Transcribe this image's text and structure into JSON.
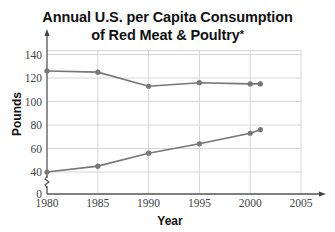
{
  "title_line1": "Annual U.S. per Capita Consumption",
  "title_line2": "of Red Meat & Poultry",
  "title_asterisk": "*",
  "chart_data": {
    "type": "line",
    "title": "Annual U.S. per Capita Consumption of Red Meat & Poultry*",
    "xlabel": "Year",
    "ylabel": "Pounds",
    "x_ticks": [
      1980,
      1985,
      1990,
      1995,
      2000,
      2005
    ],
    "y_ticks": [
      0,
      40,
      60,
      80,
      100,
      120,
      140
    ],
    "y_axis_break": "between 0 and 40",
    "xlim": [
      1980,
      2005
    ],
    "ylim": [
      0,
      140
    ],
    "grid": true,
    "legend": null,
    "series": [
      {
        "name": "Red Meat",
        "x": [
          1980,
          1985,
          1990,
          1995,
          2000,
          2001
        ],
        "values": [
          126,
          125,
          113,
          116,
          115,
          115
        ]
      },
      {
        "name": "Poultry",
        "x": [
          1980,
          1985,
          1990,
          1995,
          2000,
          2001
        ],
        "values": [
          40,
          45,
          56,
          64,
          73,
          76
        ]
      }
    ],
    "colors": {
      "line": "#777777",
      "marker": "#777777",
      "grid": "#d6d6d6",
      "axis": "#555555"
    }
  },
  "labels": {
    "x_ticks": [
      "1980",
      "1985",
      "1990",
      "1995",
      "2000",
      "2005"
    ],
    "y_ticks": [
      "0",
      "40",
      "60",
      "80",
      "100",
      "120",
      "140"
    ],
    "xlabel": "Year",
    "ylabel": "Pounds"
  }
}
